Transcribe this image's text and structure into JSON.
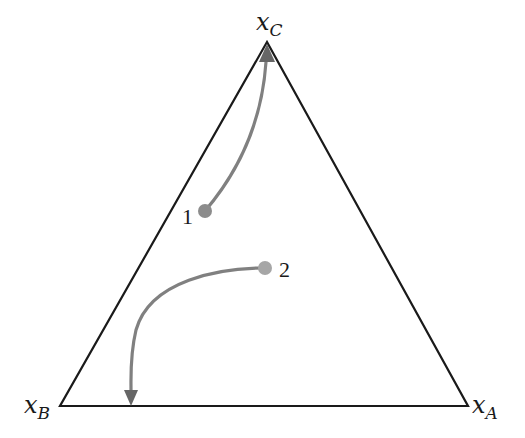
{
  "diagram": {
    "type": "ternary-phase-diagram",
    "vertices": [
      {
        "id": "C",
        "label_main": "x",
        "label_sub": "C",
        "x": 267,
        "y": 42
      },
      {
        "id": "B",
        "label_main": "x",
        "label_sub": "B",
        "x": 60,
        "y": 406
      },
      {
        "id": "A",
        "label_main": "x",
        "label_sub": "A",
        "x": 468,
        "y": 406
      }
    ],
    "trajectories": [
      {
        "label": "1",
        "start": {
          "x": 205,
          "y": 211
        },
        "end_vertex": "C",
        "arrow_tip": {
          "x": 267,
          "y": 44
        }
      },
      {
        "label": "2",
        "start": {
          "x": 265,
          "y": 268
        },
        "end_edge": "B-A",
        "arrow_tip": {
          "x": 131,
          "y": 406
        }
      }
    ],
    "colors": {
      "triangle_stroke": "#1a1a1a",
      "trajectory": "#808080",
      "start_point": "#8c8c8c",
      "start_point_2": "#a6a6a6"
    }
  }
}
